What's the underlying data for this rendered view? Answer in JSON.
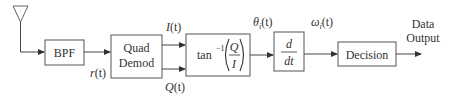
{
  "diagram": {
    "antenna": {
      "label": ""
    },
    "blocks": {
      "bpf": {
        "label": "BPF"
      },
      "quad_demod": {
        "line1": "Quad",
        "line2": "Demod"
      },
      "arctan": {
        "func": "tan",
        "exp": "−1",
        "num": "Q",
        "den": "I"
      },
      "derivative": {
        "num": "d",
        "den": "dt"
      },
      "decision": {
        "label": "Decision"
      }
    },
    "signals": {
      "r": {
        "name": "r",
        "arg": "(t)"
      },
      "i": {
        "name": "I",
        "arg": "(t)"
      },
      "q": {
        "name": "Q",
        "arg": "(t)"
      },
      "theta": {
        "name": "θ",
        "sub": "i",
        "arg": "(t)"
      },
      "omega": {
        "name": "ω",
        "sub": "i",
        "arg": "(t)"
      }
    },
    "output": {
      "line1": "Data",
      "line2": "Output"
    },
    "colors": {
      "stroke": "#555555",
      "text": "#333333",
      "background": "#ffffff"
    }
  }
}
